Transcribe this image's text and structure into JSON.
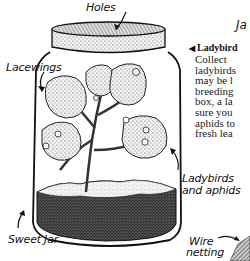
{
  "heading": "Ja",
  "caption": {
    "marker": "◀",
    "title": "Ladybird"
  },
  "body_lines": [
    "Collect",
    "ladybirds",
    "may be l",
    "breeding",
    "box, a la",
    "sure you",
    "aphids to",
    "fresh lea"
  ],
  "labels": {
    "holes": "Holes",
    "lacewings": "Lacewings",
    "ladybirds_line1": "Ladybirds",
    "ladybirds_line2": "and aphids",
    "sweet_jar": "Sweet Jar",
    "wire_line1": "Wire",
    "wire_line2": "netting"
  }
}
